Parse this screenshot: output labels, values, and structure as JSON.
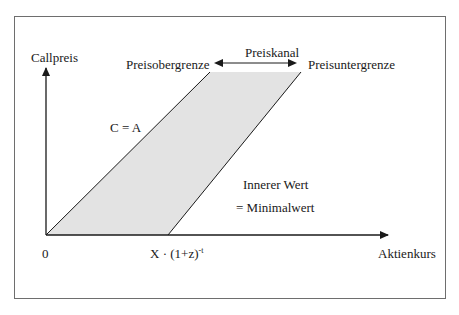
{
  "diagram": {
    "y_axis_label": "Callpreis",
    "x_axis_label": "Aktienkurs",
    "origin_label": "0",
    "x_tick_label": "X · (1+z)",
    "x_tick_exponent": "-t",
    "upper_bound_line_label": "C = A",
    "upper_bound_label": "Preisobergrenze",
    "lower_bound_label": "Preisuntergrenze",
    "channel_label": "Preiskanal",
    "intrinsic_value_label": "Innerer Wert",
    "minimum_value_label": "= Minimalwert",
    "colors": {
      "shaded_region": "#e3e3e3",
      "lines": "#1a1a1a",
      "frame": "#6e6e6e"
    }
  }
}
